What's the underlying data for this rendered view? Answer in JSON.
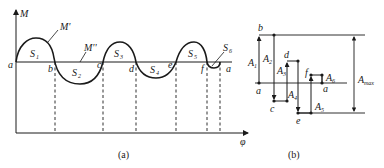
{
  "figure": {
    "panel_a": {
      "caption": "(a)",
      "y_axis_label": "M",
      "x_axis_label": "φ",
      "curve_label": "M'",
      "baseline_label": "M''",
      "points": [
        {
          "label": "a",
          "x": 16
        },
        {
          "label": "b",
          "x": 55
        },
        {
          "label": "c",
          "x": 103
        },
        {
          "label": "d",
          "x": 136
        },
        {
          "label": "e",
          "x": 176
        },
        {
          "label": "f",
          "x": 207
        },
        {
          "label": "a",
          "x": 220
        }
      ],
      "areas": [
        {
          "label": "S",
          "sub": "1",
          "sign": "positive"
        },
        {
          "label": "S",
          "sub": "2",
          "sign": "negative"
        },
        {
          "label": "S",
          "sub": "3",
          "sign": "positive"
        },
        {
          "label": "S",
          "sub": "4",
          "sign": "negative"
        },
        {
          "label": "S",
          "sub": "5",
          "sign": "positive"
        },
        {
          "label": "S",
          "sub": "6",
          "sign": "negative"
        }
      ]
    },
    "panel_b": {
      "caption": "(b)",
      "points": [
        "a",
        "b",
        "c",
        "d",
        "e",
        "f",
        "a"
      ],
      "segments": [
        {
          "label": "A",
          "sub": "1"
        },
        {
          "label": "A",
          "sub": "2"
        },
        {
          "label": "A",
          "sub": "3"
        },
        {
          "label": "A",
          "sub": "4"
        },
        {
          "label": "A",
          "sub": "5"
        },
        {
          "label": "A",
          "sub": "6"
        }
      ],
      "max_label": "A",
      "max_sub": "max"
    }
  }
}
